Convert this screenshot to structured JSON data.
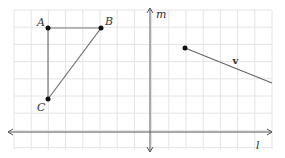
{
  "diagram": {
    "grid": {
      "x0": 14,
      "y0": 10,
      "x1": 272,
      "y1": 150,
      "step": 17.2,
      "color": "#e4e4e4"
    },
    "axes": {
      "horizontal": {
        "label": "l",
        "y": 132,
        "x_start": 8,
        "x_end": 272
      },
      "vertical": {
        "label": "m",
        "x": 150,
        "y_start": 8,
        "y_end": 152
      },
      "color": "#555555"
    },
    "triangle": {
      "points": [
        {
          "label": "A",
          "x": 48,
          "y": 28
        },
        {
          "label": "B",
          "x": 101,
          "y": 28
        },
        {
          "label": "C",
          "x": 48,
          "y": 99
        }
      ],
      "color": "#777777"
    },
    "vector": {
      "label": "v",
      "x1": 185,
      "y1": 48,
      "x2": 272,
      "y2": 83,
      "color": "#666666"
    }
  }
}
